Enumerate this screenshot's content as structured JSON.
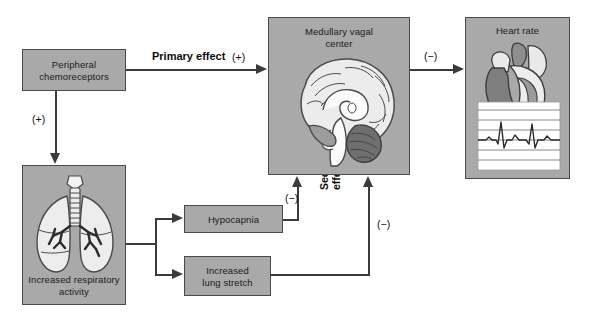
{
  "diagram": {
    "palette": {
      "box_fill": "#a9a9a9",
      "box_border": "#4a4a4a",
      "connector": "#3b3b3b",
      "background": "#ffffff",
      "tissue_light": "#e8e8e8",
      "tissue_mid": "#9a9a9a",
      "tissue_dark": "#6e6e6e"
    },
    "nodes": [
      {
        "id": "chemoreceptors",
        "label": "Peripheral\nchemoreceptors",
        "line1": "Peripheral",
        "line2": "chemoreceptors",
        "artwork": "none"
      },
      {
        "id": "respiratory",
        "label": "Increased respiratory\nactivity",
        "line1": "Increased respiratory",
        "line2": "activity",
        "artwork": "lungs-illustration"
      },
      {
        "id": "hypocapnia",
        "label": "Hypocapnia",
        "line1": "Hypocapnia",
        "line2": "",
        "artwork": "none"
      },
      {
        "id": "lung_stretch",
        "label": "Increased\nlung stretch",
        "line1": "Increased",
        "line2": "lung stretch",
        "artwork": "none"
      },
      {
        "id": "medullary",
        "label": "Medullary vagal\ncenter",
        "line1": "Medullary vagal",
        "line2": "center",
        "artwork": "brain-sagittal-illustration"
      },
      {
        "id": "heart",
        "label": "Heart rate",
        "line1": "Heart rate",
        "line2": "",
        "artwork": "heart-with-ecg-illustration"
      }
    ],
    "edges": [
      {
        "id": "chemo-to-medulla",
        "from": "chemoreceptors",
        "to": "medullary",
        "label": "Primary effect",
        "sign": "(+)",
        "label_bold": true
      },
      {
        "id": "chemo-to-respiratory",
        "from": "chemoreceptors",
        "to": "respiratory",
        "label": "",
        "sign": "(+)",
        "label_bold": false
      },
      {
        "id": "respiratory-to-hypocapnia",
        "from": "respiratory",
        "to": "hypocapnia",
        "label": "",
        "sign": "",
        "label_bold": false
      },
      {
        "id": "respiratory-to-stretch",
        "from": "respiratory",
        "to": "lung_stretch",
        "label": "",
        "sign": "",
        "label_bold": false
      },
      {
        "id": "hypocapnia-to-medulla",
        "from": "hypocapnia",
        "to": "medullary",
        "label": "",
        "sign": "(−)",
        "label_bold": false
      },
      {
        "id": "stretch-to-medulla",
        "from": "lung_stretch",
        "to": "medullary",
        "label": "",
        "sign": "(−)",
        "label_bold": false
      },
      {
        "id": "medulla-to-heart",
        "from": "medullary",
        "to": "heart",
        "label": "",
        "sign": "(−)",
        "label_bold": false
      }
    ],
    "annotations": {
      "secondary_effects_line1": "Secondary",
      "secondary_effects_line2": "effects"
    }
  }
}
